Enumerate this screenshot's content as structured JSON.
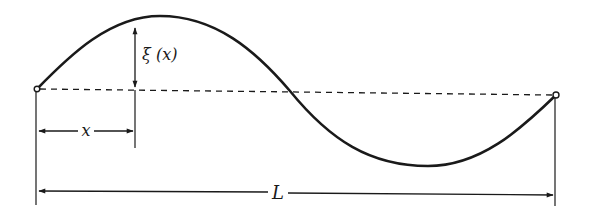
{
  "diagram": {
    "colors": {
      "ink": "#1a1a1a",
      "background": "#ffffff"
    },
    "labels": {
      "displacement": "ξ (x)",
      "position": "x",
      "length": "L"
    },
    "elements": {
      "string_curve": "one full sine period, peak near left third, trough near right two-thirds",
      "equilibrium_line": "dashed horizontal line between endpoints",
      "endpoints": [
        "left fixed point (open circle)",
        "right fixed point (open circle)"
      ],
      "dimensions": [
        "ξ(x) vertical arrow from equilibrium to curve",
        "x horizontal arrow from left end",
        "L horizontal arrow spanning full length"
      ]
    }
  }
}
